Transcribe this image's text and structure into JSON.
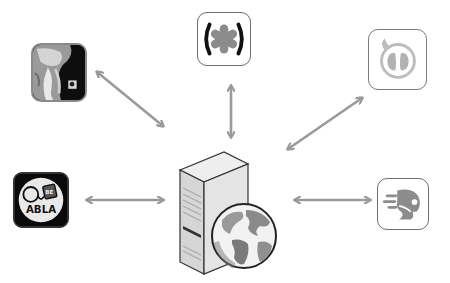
{
  "diagram": {
    "type": "hub-and-spoke",
    "hub": {
      "label": "server-with-globe",
      "icon": "web-server-icon"
    },
    "nodes": [
      {
        "id": "xray-app",
        "icon": "neck-xray-icon",
        "position": "top-left"
      },
      {
        "id": "asterisk-app",
        "icon": "asterisk-in-parentheses-icon",
        "position": "top-center"
      },
      {
        "id": "lungs-app",
        "icon": "lungs-speech-bubble-icon",
        "position": "top-right"
      },
      {
        "id": "abla-app",
        "icon": "abla-icon",
        "label": "ABLA",
        "position": "middle-left"
      },
      {
        "id": "speed-app",
        "icon": "speeding-face-icon",
        "position": "middle-right"
      }
    ],
    "connections": [
      {
        "from": "xray-app",
        "to": "server",
        "style": "double-arrow"
      },
      {
        "from": "asterisk-app",
        "to": "server",
        "style": "double-arrow"
      },
      {
        "from": "lungs-app",
        "to": "server",
        "style": "double-arrow"
      },
      {
        "from": "abla-app",
        "to": "server",
        "style": "double-arrow"
      },
      {
        "from": "speed-app",
        "to": "server",
        "style": "double-arrow"
      }
    ],
    "colors": {
      "arrow": "#9a9a9a",
      "icon_border": "#7a7a7a",
      "background": "#ffffff"
    }
  }
}
